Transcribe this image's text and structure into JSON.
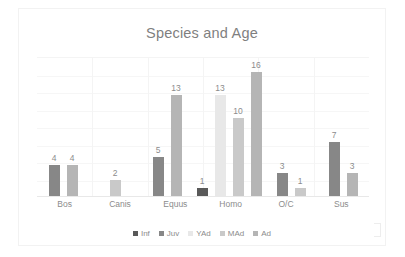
{
  "chart_data": {
    "type": "bar",
    "title": "Species and Age",
    "xlabel": "",
    "ylabel": "",
    "ylim": [
      0,
      18
    ],
    "grid": true,
    "legend_position": "bottom",
    "categories": [
      "Bos",
      "Canis",
      "Equus",
      "Homo",
      "O/C",
      "Sus"
    ],
    "series": [
      {
        "name": "Inf",
        "color": "#595959",
        "values": [
          null,
          null,
          null,
          1,
          null,
          null
        ]
      },
      {
        "name": "Juv",
        "color": "#878787",
        "values": [
          4,
          null,
          5,
          null,
          3,
          7
        ]
      },
      {
        "name": "YAd",
        "color": "#e8e8e8",
        "values": [
          null,
          null,
          null,
          13,
          null,
          null
        ]
      },
      {
        "name": "MAd",
        "color": "#c9c9c9",
        "values": [
          null,
          null,
          null,
          10,
          1,
          null
        ]
      },
      {
        "name": "Ad",
        "color": "#b5b5b5",
        "values": [
          4,
          2,
          13,
          16,
          null,
          3
        ]
      }
    ],
    "bars": [
      {
        "category": "Bos",
        "series": "Juv",
        "value": 4,
        "label": "4",
        "color": "#878787"
      },
      {
        "category": "Bos",
        "series": "Ad",
        "value": 4,
        "label": "4",
        "color": "#b5b5b5"
      },
      {
        "category": "Canis",
        "series": "Ad",
        "value": 2,
        "label": "2",
        "color": "#c9c9c9"
      },
      {
        "category": "Equus",
        "series": "Juv",
        "value": 5,
        "label": "5",
        "color": "#878787"
      },
      {
        "category": "Equus",
        "series": "Ad",
        "value": 13,
        "label": "13",
        "color": "#b5b5b5"
      },
      {
        "category": "Homo",
        "series": "Inf",
        "value": 1,
        "label": "1",
        "color": "#595959"
      },
      {
        "category": "Homo",
        "series": "YAd",
        "value": 13,
        "label": "13",
        "color": "#e8e8e8"
      },
      {
        "category": "Homo",
        "series": "MAd",
        "value": 10,
        "label": "10",
        "color": "#c9c9c9"
      },
      {
        "category": "Homo",
        "series": "Ad",
        "value": 16,
        "label": "16",
        "color": "#b5b5b5"
      },
      {
        "category": "O/C",
        "series": "Juv",
        "value": 3,
        "label": "3",
        "color": "#878787"
      },
      {
        "category": "O/C",
        "series": "MAd",
        "value": 1,
        "label": "1",
        "color": "#c9c9c9"
      },
      {
        "category": "Sus",
        "series": "Juv",
        "value": 7,
        "label": "7",
        "color": "#878787"
      },
      {
        "category": "Sus",
        "series": "Ad",
        "value": 3,
        "label": "3",
        "color": "#b5b5b5"
      }
    ]
  },
  "colors": {
    "title_text": "#7f7f7f",
    "axis_text": "#8c8c8c",
    "gridline": "#f4f4f4",
    "card_border": "#f2f2f2",
    "background": "#ffffff"
  }
}
